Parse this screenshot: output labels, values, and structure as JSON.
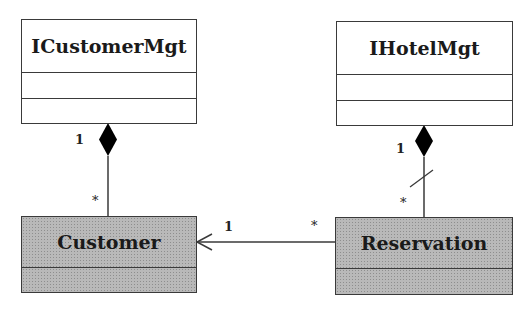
{
  "diagram": {
    "type": "UML class diagram",
    "classes": [
      {
        "id": "icustomermgt",
        "name": "ICustomerMgt",
        "style": "plain"
      },
      {
        "id": "ihotelmgt",
        "name": "IHotelMgt",
        "style": "plain"
      },
      {
        "id": "customer",
        "name": "Customer",
        "style": "shaded"
      },
      {
        "id": "reservation",
        "name": "Reservation",
        "style": "shaded"
      }
    ],
    "relationships": [
      {
        "type": "composition",
        "whole": "ICustomerMgt",
        "part": "Customer",
        "whole_multiplicity": "1",
        "part_multiplicity": "*"
      },
      {
        "type": "composition",
        "whole": "IHotelMgt",
        "part": "Reservation",
        "whole_multiplicity": "1",
        "part_multiplicity": "*",
        "note": "slash mark on link"
      },
      {
        "type": "directed-association",
        "from": "Reservation",
        "to": "Customer",
        "target_multiplicity": "1",
        "source_multiplicity": "*"
      }
    ],
    "colors": {
      "line": "#3a3a3a",
      "shaded_fill": "#b9b9b9",
      "diamond": "#000000"
    }
  }
}
